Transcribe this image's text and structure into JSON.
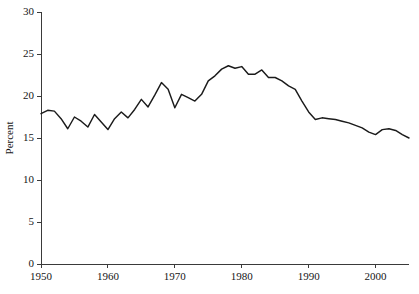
{
  "chart_data": {
    "type": "line",
    "title": "",
    "subtitle": "",
    "xlabel": "",
    "ylabel": "Percent",
    "xlim": [
      1950,
      2005
    ],
    "ylim": [
      0,
      30
    ],
    "grid": false,
    "legend": false,
    "legend_position": "none",
    "x_ticks": [
      1950,
      1960,
      1970,
      1980,
      1990,
      2000
    ],
    "x_tick_labels": [
      "1950",
      "1960",
      "1970",
      "1980",
      "1990",
      "2000"
    ],
    "y_ticks": [
      0,
      5,
      10,
      15,
      20,
      25,
      30
    ],
    "y_tick_labels": [
      "0",
      "5",
      "10",
      "15",
      "20",
      "25",
      "30"
    ],
    "line_color": "#1b1b1b",
    "axis_color": "#3a3a3a",
    "background_color": "#ffffff",
    "series": [
      {
        "name": "Percent",
        "x": [
          1950,
          1951,
          1952,
          1953,
          1954,
          1955,
          1956,
          1957,
          1958,
          1959,
          1960,
          1961,
          1962,
          1963,
          1964,
          1965,
          1966,
          1967,
          1968,
          1969,
          1970,
          1971,
          1972,
          1973,
          1974,
          1975,
          1976,
          1977,
          1978,
          1979,
          1980,
          1981,
          1982,
          1983,
          1984,
          1985,
          1986,
          1987,
          1988,
          1989,
          1990,
          1991,
          1992,
          1993,
          1994,
          1995,
          1996,
          1997,
          1998,
          1999,
          2000,
          2001,
          2002,
          2003,
          2004,
          2005
        ],
        "values": [
          17.9,
          18.3,
          18.2,
          17.3,
          16.1,
          17.5,
          17.0,
          16.3,
          17.8,
          16.9,
          16.0,
          17.3,
          18.1,
          17.4,
          18.4,
          19.6,
          18.7,
          20.1,
          21.6,
          20.8,
          18.6,
          20.2,
          19.8,
          19.4,
          20.2,
          21.8,
          22.4,
          23.2,
          23.6,
          23.3,
          23.5,
          22.6,
          22.6,
          23.1,
          22.2,
          22.2,
          21.8,
          21.2,
          20.8,
          19.4,
          18.1,
          17.2,
          17.4,
          17.3,
          17.2,
          17.0,
          16.8,
          16.5,
          16.2,
          15.7,
          15.4,
          16.0,
          16.1,
          15.9,
          15.4,
          15.0
        ]
      }
    ]
  }
}
